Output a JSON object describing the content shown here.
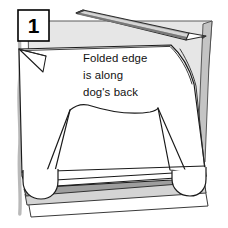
{
  "figure": {
    "step_number": "1",
    "instruction_lines": [
      "Folded edge",
      "is along",
      "dog's back"
    ],
    "instruction_full": "Folded edge is along dog's back",
    "objects": [
      "step-number-box",
      "pencil",
      "folded-paper-sheet",
      "dog-body-outline",
      "dog-paw-left",
      "dog-paw-right",
      "paper-stack-layers",
      "left-margin-rule"
    ]
  },
  "colors": {
    "ink": "#1a1a1a",
    "paper_white": "#ffffff",
    "shade_light": "#e3e3e3",
    "shade_mid": "#c9c9c9",
    "shade_dark": "#9a9a9a",
    "pencil_body": "#a8a8a8",
    "pencil_dark": "#6e6e6e",
    "margin_rule": "#b8b8b8",
    "text": "#111111",
    "background": "#ffffff"
  },
  "step_box": {
    "label": "1"
  },
  "canvas": {
    "width": "228",
    "height": "228"
  }
}
